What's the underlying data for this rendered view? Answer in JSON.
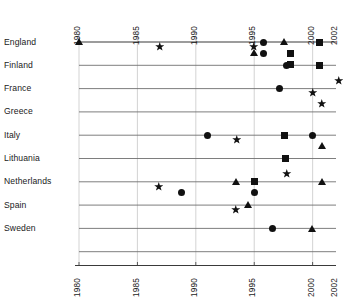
{
  "chart_data": {
    "type": "scatter",
    "title": "",
    "subtitle": "",
    "xlabel": "",
    "ylabel": "",
    "xlim": [
      1979.0,
      2002.6
    ],
    "grid": true,
    "legend_position": "none",
    "axis_label_rotation": -90,
    "x_ticks": [
      1980,
      1985,
      1990,
      1995,
      2000,
      2002
    ],
    "x_tick_labels": [
      "1980",
      "1985",
      "1990",
      "1995",
      "2000",
      "2002"
    ],
    "x_axis_top_labels": [
      "1980",
      "1985",
      "1990",
      "1995",
      "2000",
      "2002"
    ],
    "x_axis_bottom_labels": [
      "1980",
      "1985",
      "1990",
      "1995",
      "2000",
      "2002"
    ],
    "categories": [
      "England",
      "Finland",
      "France",
      "Greece",
      "Italy",
      "Lithuania",
      "Netherlands",
      "Spain",
      "Sweden"
    ],
    "marker_shapes": [
      "triangle",
      "star",
      "circle",
      "square"
    ],
    "series": [
      {
        "name": "England",
        "points": [
          {
            "x": 1980.0,
            "marker": "triangle",
            "row": 0
          },
          {
            "x": 1986.9,
            "marker": "star",
            "row": 0
          },
          {
            "x": 1995.0,
            "marker": "star",
            "row": 0
          },
          {
            "x": 1995.8,
            "marker": "circle",
            "row": 0
          },
          {
            "x": 1997.6,
            "marker": "triangle",
            "row": 0
          },
          {
            "x": 2000.6,
            "marker": "square",
            "row": 0
          },
          {
            "x": 1995.0,
            "marker": "triangle",
            "row": 1
          },
          {
            "x": 1995.8,
            "marker": "circle",
            "row": 1
          },
          {
            "x": 1998.1,
            "marker": "square",
            "row": 1
          },
          {
            "x": 1998.1,
            "marker": "square",
            "row": 2
          }
        ]
      },
      {
        "name": "Finland",
        "points": [
          {
            "x": 1997.8,
            "marker": "circle",
            "row": 0
          },
          {
            "x": 2000.6,
            "marker": "square",
            "row": 0
          },
          {
            "x": 2002.2,
            "marker": "star",
            "row": 1
          }
        ]
      },
      {
        "name": "France",
        "points": [
          {
            "x": 1997.2,
            "marker": "circle",
            "row": 0
          },
          {
            "x": 2000.0,
            "marker": "star",
            "row": 0
          },
          {
            "x": 2000.8,
            "marker": "star",
            "row": 1
          }
        ]
      },
      {
        "name": "Greece",
        "points": []
      },
      {
        "name": "Italy",
        "points": [
          {
            "x": 1991.0,
            "marker": "circle",
            "row": 0
          },
          {
            "x": 1993.5,
            "marker": "star",
            "row": 0
          },
          {
            "x": 1997.6,
            "marker": "square",
            "row": 0
          },
          {
            "x": 2000.0,
            "marker": "circle",
            "row": 0
          },
          {
            "x": 2000.8,
            "marker": "triangle",
            "row": 1
          }
        ]
      },
      {
        "name": "Lithuania",
        "points": [
          {
            "x": 1997.7,
            "marker": "square",
            "row": 0
          },
          {
            "x": 1997.8,
            "marker": "star",
            "row": 1
          }
        ]
      },
      {
        "name": "Netherlands",
        "points": [
          {
            "x": 1986.8,
            "marker": "star",
            "row": 0
          },
          {
            "x": 1993.5,
            "marker": "triangle",
            "row": 0
          },
          {
            "x": 1995.0,
            "marker": "square",
            "row": 0
          },
          {
            "x": 2000.8,
            "marker": "triangle",
            "row": 0
          },
          {
            "x": 1988.8,
            "marker": "circle",
            "row": 1
          },
          {
            "x": 1995.0,
            "marker": "circle",
            "row": 1
          }
        ]
      },
      {
        "name": "Spain",
        "points": [
          {
            "x": 1993.4,
            "marker": "star",
            "row": 0
          },
          {
            "x": 1994.5,
            "marker": "triangle",
            "row": 0
          }
        ]
      },
      {
        "name": "Sweden",
        "points": [
          {
            "x": 1996.6,
            "marker": "circle",
            "row": 0
          },
          {
            "x": 2000.0,
            "marker": "triangle",
            "row": 0
          }
        ]
      }
    ],
    "colors": {
      "marker": "#111111",
      "row_line": "#6f6f6f",
      "grid_line": "#c8c8c8",
      "axis_line": "#3a3a3a",
      "background": "#ffffff"
    }
  }
}
